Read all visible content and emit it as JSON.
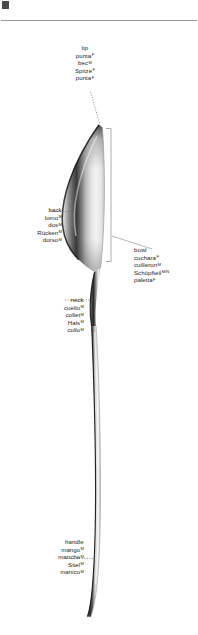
{
  "page": {
    "background_color": "#ffffff",
    "text_color": "#231f20",
    "rule_color": "#9a9a9a",
    "leader_color": "#8c8c8c"
  },
  "labels": {
    "tip": {
      "anchor": "center",
      "terms": [
        {
          "text": "tip",
          "gender": ""
        },
        {
          "text": "punta",
          "gender": "F"
        },
        {
          "text": "bec",
          "gender": "M"
        },
        {
          "text": "Spitze",
          "gender": "F"
        },
        {
          "text": "punta",
          "gender": "F"
        }
      ]
    },
    "back": {
      "anchor": "right",
      "terms": [
        {
          "text": "back",
          "gender": ""
        },
        {
          "text": "lomo",
          "gender": "M"
        },
        {
          "text": "dos",
          "gender": "M"
        },
        {
          "text": "Rücken",
          "gender": "M"
        },
        {
          "text": "dorso",
          "gender": "M"
        }
      ]
    },
    "bowl": {
      "anchor": "left",
      "terms": [
        {
          "text": "bowl",
          "gender": ""
        },
        {
          "text": "cuchara",
          "gender": "F"
        },
        {
          "text": "cuilleron",
          "gender": "M"
        },
        {
          "text": "Schöpfteil",
          "gender": "M/N"
        },
        {
          "text": "paletta",
          "gender": "F"
        }
      ]
    },
    "neck": {
      "anchor": "right",
      "terms": [
        {
          "text": "neck",
          "gender": ""
        },
        {
          "text": "cuello",
          "gender": "M"
        },
        {
          "text": "collet",
          "gender": "M"
        },
        {
          "text": "Hals",
          "gender": "M"
        },
        {
          "text": "collo",
          "gender": "M"
        }
      ]
    },
    "handle": {
      "anchor": "right",
      "terms": [
        {
          "text": "handle",
          "gender": ""
        },
        {
          "text": "mango",
          "gender": "M"
        },
        {
          "text": "manche",
          "gender": "M"
        },
        {
          "text": "Stiel",
          "gender": "M"
        },
        {
          "text": "manico",
          "gender": "M"
        }
      ]
    }
  },
  "illustration": {
    "name": "spoon",
    "description": "Side view of a stainless steel spoon, bowl at top tapering to a slender handle at the bottom.",
    "bracket": {
      "label_for": "bowl",
      "x": 110,
      "top": 128,
      "bottom": 262
    }
  }
}
